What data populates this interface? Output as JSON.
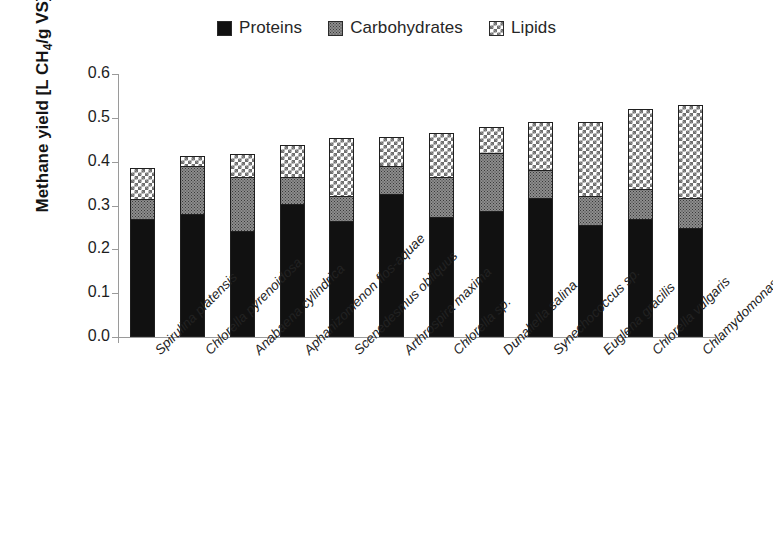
{
  "chart_data": {
    "type": "bar",
    "stacked": true,
    "title": "",
    "subtitle": "",
    "xlabel": "",
    "ylabel": "Methane yield [L CH4/g VS]",
    "ylim": [
      0.0,
      0.6
    ],
    "ytick_labels": [
      "0.6",
      "0.5",
      "0.4",
      "0.3",
      "0.2",
      "0.1",
      "0.0"
    ],
    "ytick_values": [
      0.6,
      0.5,
      0.4,
      0.3,
      0.2,
      0.1,
      0.0
    ],
    "grid": false,
    "legend_position": "top-center",
    "categories": [
      "Spirulina platensis",
      "Chlorella pyrenoidosa",
      "Anabaena cylindrica",
      "Aphanizomenon flos-aquae",
      "Scenedesmus obliquus",
      "Arthrospira maxima",
      "Chlorella sp.",
      "Dunaliella salina",
      "Synechococcus sp.",
      "Euglena gracilis",
      "Chlorella vulgaris",
      "Chlamydomonas rheinhardii"
    ],
    "series": [
      {
        "name": "Proteins",
        "color": "#111111",
        "pattern": "solid",
        "values": [
          0.27,
          0.281,
          0.241,
          0.304,
          0.265,
          0.327,
          0.273,
          0.288,
          0.318,
          0.255,
          0.27,
          0.248
        ]
      },
      {
        "name": "Carbohydrates",
        "color": "#8d8d8d",
        "pattern": "dotted",
        "values": [
          0.044,
          0.11,
          0.123,
          0.06,
          0.057,
          0.063,
          0.091,
          0.132,
          0.062,
          0.066,
          0.068,
          0.07
        ]
      },
      {
        "name": "Lipids",
        "color": "#ffffff",
        "pattern": "checkered",
        "values": [
          0.071,
          0.021,
          0.054,
          0.074,
          0.131,
          0.066,
          0.101,
          0.06,
          0.111,
          0.17,
          0.182,
          0.211
        ]
      }
    ],
    "totals": [
      0.385,
      0.412,
      0.418,
      0.438,
      0.453,
      0.456,
      0.465,
      0.48,
      0.491,
      0.491,
      0.52,
      0.529
    ]
  },
  "legend": {
    "items": [
      {
        "label": "Proteins",
        "swatch": "solid-black-swatch"
      },
      {
        "label": "Carbohydrates",
        "swatch": "dotted-gray-swatch"
      },
      {
        "label": "Lipids",
        "swatch": "checkered-swatch"
      }
    ]
  },
  "axes": {
    "y_label_prefix": "Methane yield [L CH",
    "y_label_sub": "4",
    "y_label_suffix": "/g VS]"
  }
}
